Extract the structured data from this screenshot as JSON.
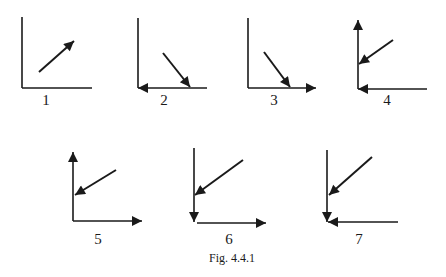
{
  "figure": {
    "caption": "Fig. 4.4.1",
    "stroke_color": "#1a1a1a",
    "panels": [
      {
        "label": "1",
        "description": "axes with diagonal arrow pointing up-right"
      },
      {
        "label": "2",
        "description": "axes, diagonal arrow down-right hitting x-axis, x-axis arrow pointing left"
      },
      {
        "label": "3",
        "description": "axes, diagonal arrow down-right hitting x-axis, x-axis arrow pointing right"
      },
      {
        "label": "4",
        "description": "y-axis arrow up, diagonal arrow down-left hitting y-axis, x-axis arrow pointing left"
      },
      {
        "label": "5",
        "description": "y-axis arrow up, diagonal arrow down-left hitting y-axis, x-axis arrow pointing right"
      },
      {
        "label": "6",
        "description": "y-axis arrow down, diagonal arrow down-left hitting y-axis, x-axis arrow pointing right"
      },
      {
        "label": "7",
        "description": "y-axis arrow down, diagonal arrow down-left hitting y-axis, x-axis arrow pointing left"
      }
    ]
  }
}
